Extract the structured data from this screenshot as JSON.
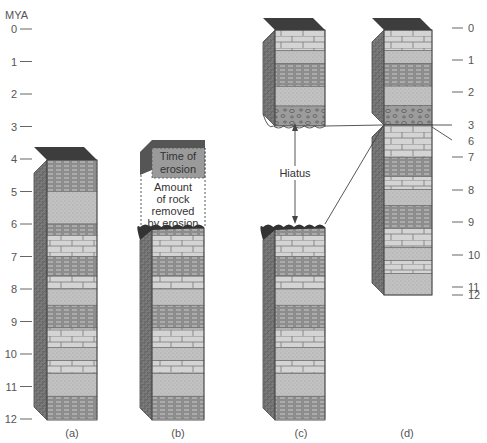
{
  "axis": {
    "title": "MYA",
    "left_ticks": [
      "0",
      "1",
      "2",
      "3",
      "4",
      "5",
      "6",
      "7",
      "8",
      "9",
      "10",
      "11",
      "12"
    ],
    "right_ticks": [
      "0",
      "1",
      "2",
      "3",
      "6",
      "7",
      "8",
      "9",
      "10",
      "11",
      "12"
    ]
  },
  "columns": [
    {
      "id": "a",
      "caption": "(a)"
    },
    {
      "id": "b",
      "caption": "(b)"
    },
    {
      "id": "c",
      "caption": "(c)"
    },
    {
      "id": "d",
      "caption": "(d)"
    }
  ],
  "annotations": {
    "time_of_erosion": [
      "Time of",
      "erosion"
    ],
    "amount_removed": [
      "Amount",
      "of rock",
      "removed",
      "by erosion"
    ],
    "hiatus": "Hiatus"
  },
  "colors": {
    "top_cap": "#3a3a3a",
    "shale": "#8a8a8a",
    "sandstone": "#bdbdbd",
    "limestone": "#d2d2d2",
    "conglomerate": "#9a9a9a",
    "erosion_surface": "#333333",
    "side_dark": "#6e6e6e",
    "line": "#555555"
  }
}
